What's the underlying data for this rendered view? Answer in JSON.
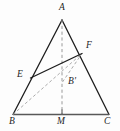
{
  "figure": {
    "width": 120,
    "height": 131,
    "background_color": "#fdfdfd",
    "stroke_color": "#1d1d1d",
    "dash_color": "#8f8f8f",
    "base_color": "#555555",
    "labels": [
      {
        "id": "A",
        "text": "A",
        "x": 59,
        "y": 3,
        "name": "vertex-label-a"
      },
      {
        "id": "F",
        "text": "F",
        "x": 86,
        "y": 41,
        "name": "vertex-label-f"
      },
      {
        "id": "E",
        "text": "E",
        "x": 17,
        "y": 70,
        "name": "vertex-label-e"
      },
      {
        "id": "Bp",
        "text": "B'",
        "x": 68,
        "y": 77,
        "name": "vertex-label-b-prime"
      },
      {
        "id": "B",
        "text": "B",
        "x": 9,
        "y": 117,
        "name": "vertex-label-b"
      },
      {
        "id": "M",
        "text": "M",
        "x": 57,
        "y": 117,
        "name": "vertex-label-m"
      },
      {
        "id": "C",
        "text": "C",
        "x": 104,
        "y": 117,
        "name": "vertex-label-c"
      }
    ],
    "points": {
      "A": {
        "x": 62,
        "y": 20
      },
      "B": {
        "x": 13,
        "y": 114.5
      },
      "C": {
        "x": 109,
        "y": 114.5
      },
      "M": {
        "x": 62,
        "y": 114.5
      },
      "E": {
        "x": 30.5,
        "y": 78
      },
      "F": {
        "x": 82,
        "y": 53.5
      },
      "Bp": {
        "x": 62.5,
        "y": 82
      }
    },
    "segments": [
      {
        "id": "AB",
        "from": "A",
        "to": "B",
        "style": "solid",
        "name": "segment-ab"
      },
      {
        "id": "AC",
        "from": "A",
        "to": "C",
        "style": "solid",
        "name": "segment-ac"
      },
      {
        "id": "BC",
        "from": "B",
        "to": "C",
        "style": "solid-base",
        "name": "segment-bc"
      },
      {
        "id": "EF",
        "from": "E",
        "to": "F",
        "style": "solid",
        "name": "segment-ef"
      },
      {
        "id": "AM",
        "from": "A",
        "to": "M",
        "style": "dashed",
        "name": "segment-am"
      },
      {
        "id": "BF",
        "from": "B",
        "to": "F",
        "style": "dashed",
        "name": "segment-bf"
      },
      {
        "id": "BpF",
        "from": "Bp",
        "to": "F",
        "style": "dashed",
        "name": "segment-bprime-f"
      }
    ],
    "tick": {
      "x": 62,
      "y_top": 109.5,
      "y_bottom": 114.5,
      "name": "midpoint-tick-m"
    }
  }
}
